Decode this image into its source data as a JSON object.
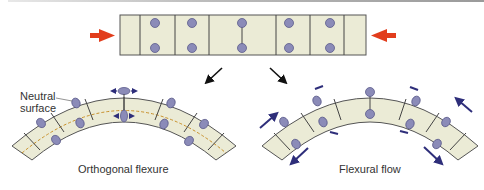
{
  "colors": {
    "layer_fill": "#ebebd6",
    "outline": "#4a4a4a",
    "marker_fill": "#8b8bb8",
    "marker_stroke": "#5a5a8a",
    "compression_arrow": "#e23d1c",
    "shear_arrow": "#2e2e7a",
    "neutral_surface": "#c8902a",
    "pointer_arrow": "#111111"
  },
  "top_panel": {
    "name": "undeformed-layer",
    "compression_arrows": [
      "right-pointing",
      "left-pointing"
    ]
  },
  "panels": {
    "left": {
      "label": "Orthogonal flexure",
      "annotation_line1": "Neutral",
      "annotation_line2": "surface"
    },
    "right": {
      "label": "Flexural flow"
    }
  }
}
